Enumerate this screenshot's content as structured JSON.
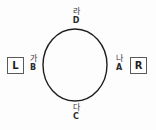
{
  "diagram": {
    "type": "circle-with-cardinal-labels",
    "background_color": "#fdfdfd",
    "stroke_color": "#1f1f1f",
    "circle": {
      "center_x": 75,
      "center_y": 65,
      "radius_x": 33,
      "radius_y": 37
    },
    "vertices": {
      "top": {
        "korean": "라",
        "latin": "D"
      },
      "right": {
        "korean": "나",
        "latin": "A"
      },
      "bottom": {
        "korean": "다",
        "latin": "C"
      },
      "left": {
        "korean": "가",
        "latin": "B"
      }
    },
    "side_markers": {
      "left": {
        "label": "L"
      },
      "right": {
        "label": "R"
      }
    }
  }
}
